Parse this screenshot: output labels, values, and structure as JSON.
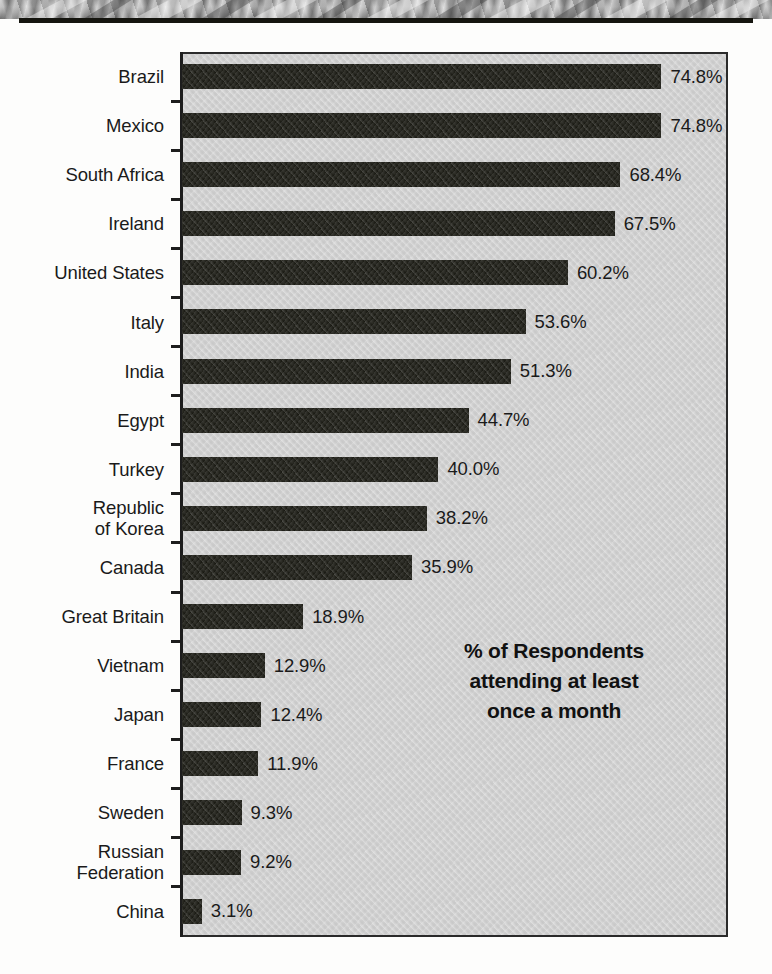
{
  "banner": {
    "type": "photo-strip",
    "description": "grayscale rock texture band"
  },
  "chart_data": {
    "type": "bar",
    "orientation": "horizontal",
    "title": "",
    "subtitle": "",
    "xlabel": "",
    "ylabel": "",
    "annotation": "% of Respondents\nattending at least\nonce a month",
    "xlim": [
      0,
      74.8
    ],
    "grid": false,
    "legend": null,
    "bar_color": "#16160f",
    "plot_background": "#d2d2d2",
    "categories": [
      "Brazil",
      "Mexico",
      "South Africa",
      "Ireland",
      "United States",
      "Italy",
      "India",
      "Egypt",
      "Turkey",
      "Republic\nof Korea",
      "Canada",
      "Great Britain",
      "Vietnam",
      "Japan",
      "France",
      "Sweden",
      "Russian\nFederation",
      "China"
    ],
    "values": [
      74.8,
      74.8,
      68.4,
      67.5,
      60.2,
      53.6,
      51.3,
      44.7,
      40.0,
      38.2,
      35.9,
      18.9,
      12.9,
      12.4,
      11.9,
      9.3,
      9.2,
      3.1
    ],
    "value_labels": [
      "74.8%",
      "74.8%",
      "68.4%",
      "67.5%",
      "60.2%",
      "53.6%",
      "51.3%",
      "44.7%",
      "40.0%",
      "38.2%",
      "35.9%",
      "18.9%",
      "12.9%",
      "12.4%",
      "11.9%",
      "9.3%",
      "9.2%",
      "3.1%"
    ]
  }
}
